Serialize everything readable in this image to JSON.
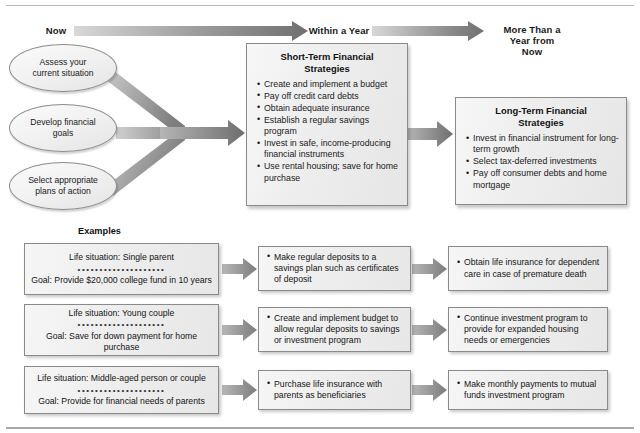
{
  "timeline": {
    "labels": [
      {
        "id": "now",
        "text": "Now"
      },
      {
        "id": "within-a-year",
        "text": "Within a Year"
      },
      {
        "id": "more-than-a-year",
        "text": "More Than a\nYear from\nNow"
      }
    ],
    "arrow_color": "#808080"
  },
  "steps": [
    {
      "id": "assess",
      "text": "Assess your\ncurrent situation"
    },
    {
      "id": "develop-goals",
      "text": "Develop financial\ngoals"
    },
    {
      "id": "select-plans",
      "text": "Select appropriate\nplans of action"
    }
  ],
  "short_term": {
    "title": "Short-Term Financial\nStrategies",
    "items": [
      "Create and implement a budget",
      "Pay off credit card debts",
      "Obtain adequate insurance",
      "Establish a regular savings program",
      "Invest in safe, income-producing financial instruments",
      "Use rental housing; save for home purchase"
    ]
  },
  "long_term": {
    "title": "Long-Term Financial\nStrategies",
    "items": [
      "Invest in financial instrument for long-term growth",
      "Select tax-deferred investments",
      "Pay off consumer debts and home mortgage"
    ]
  },
  "examples": {
    "heading": "Examples",
    "dots": "••••••••••••••••••••",
    "rows": [
      {
        "id": "single-parent",
        "situation": "Life situation: Single parent",
        "goal": "Goal: Provide $20,000 college fund in 10 years",
        "short_term_action": "Make regular deposits to a savings plan such as certificates of deposit",
        "long_term_action": "Obtain life insurance for dependent care in case of premature death"
      },
      {
        "id": "young-couple",
        "situation": "Life situation: Young couple",
        "goal": "Goal: Save for down payment for home purchase",
        "short_term_action": "Create and implement budget to allow regular deposits to savings or investment program",
        "long_term_action": "Continue investment program to provide for expanded housing needs or emergencies"
      },
      {
        "id": "middle-aged",
        "situation": "Life situation: Middle-aged person or couple",
        "goal": "Goal: Provide for financial needs of parents",
        "short_term_action": "Purchase life insurance with parents as beneficiaries",
        "long_term_action": "Make monthly payments to mutual funds investment program"
      }
    ]
  },
  "colors": {
    "box_border": "#8a8a8a",
    "box_fill": "#ededed",
    "arrow_gray": "#8c8c8c",
    "text": "#1a1a1a"
  }
}
